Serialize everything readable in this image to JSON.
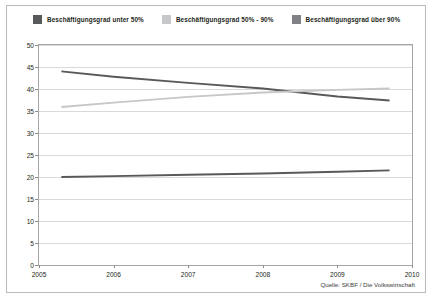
{
  "figure": {
    "source_note": "Quelle: SKBF / Die Volkswirtschaft"
  },
  "legend": {
    "items": [
      {
        "label": "Beschäftigungsgrad unter 50%",
        "color": "#58595b",
        "swatch_name": "legend-swatch-unter-50"
      },
      {
        "label": "Beschäftigungsgrad 50% - 90%",
        "color": "#c6c7c8",
        "swatch_name": "legend-swatch-50-90"
      },
      {
        "label": "Beschäftigungsgrad über 90%",
        "color": "#808285",
        "swatch_name": "legend-swatch-ueber-90"
      }
    ]
  },
  "chart_data": {
    "type": "line",
    "title": "",
    "subtitle": "",
    "xlabel": "",
    "ylabel": "",
    "xlim": [
      2005,
      2010
    ],
    "ylim": [
      0,
      50
    ],
    "ytick_step": 5,
    "grid": true,
    "legend_position": "top-left",
    "xticks": [
      "2005",
      "2006",
      "2007",
      "2008",
      "2009",
      "2010"
    ],
    "yticks": [
      "0",
      "5",
      "10",
      "15",
      "20",
      "25",
      "30",
      "35",
      "40",
      "45",
      "50"
    ],
    "x": [
      2005.3,
      2006.0,
      2007.0,
      2008.0,
      2009.0,
      2009.7
    ],
    "series": [
      {
        "name": "Beschäftigungsgrad unter 50%",
        "color": "#58595b",
        "values": [
          44.0,
          42.8,
          41.4,
          40.1,
          38.3,
          37.4
        ]
      },
      {
        "name": "Beschäftigungsgrad 50% - 90%",
        "color": "#c6c7c8",
        "values": [
          35.9,
          36.9,
          38.2,
          39.2,
          39.8,
          40.1
        ]
      },
      {
        "name": "Beschäftigungsgrad über 90%",
        "color": "#58595b",
        "values": [
          20.0,
          20.2,
          20.5,
          20.8,
          21.2,
          21.5
        ]
      }
    ]
  }
}
